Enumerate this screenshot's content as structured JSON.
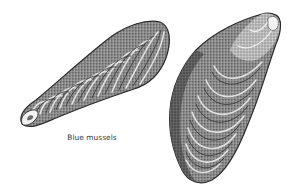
{
  "figure": {
    "caption": "Blue mussels",
    "subjects": [
      {
        "name": "left-mussel",
        "orientation": "diagonal, umbo lower-left"
      },
      {
        "name": "right-mussel",
        "orientation": "diagonal, umbo upper-right"
      }
    ],
    "colors": {
      "background": "#ffffff",
      "ink_dark": "#2b2b2b",
      "ink_mid": "#6e6e6e",
      "ink_light": "#b5b5b5",
      "caption": "#3a3a3a"
    }
  }
}
